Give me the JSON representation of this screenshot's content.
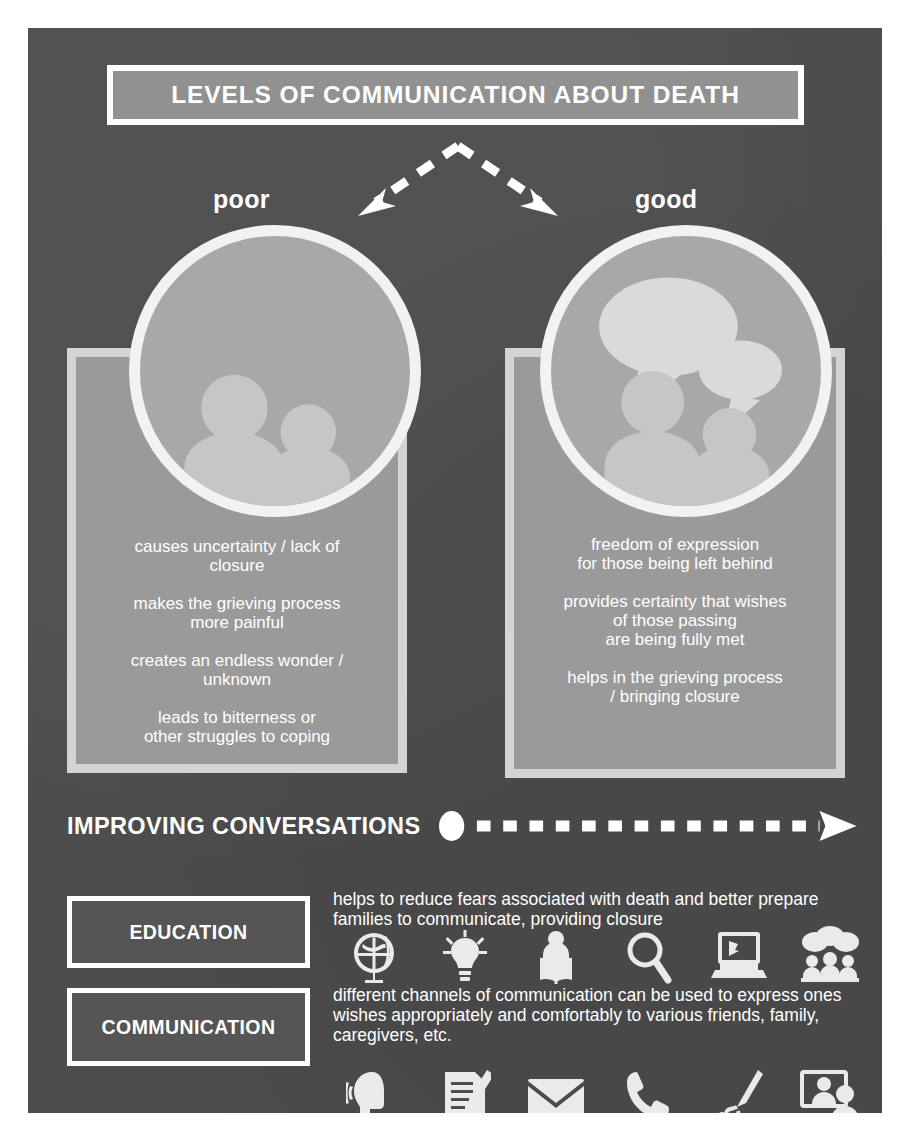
{
  "colors": {
    "background": "#ffffff",
    "poster": "#4c4c4c",
    "title_fill": "#919191",
    "panel_fill": "#9a9a9a",
    "panel_border": "#d4d4d4",
    "circle_fill": "#a8a8a8",
    "circle_border": "#f2f2f2",
    "tag_fill": "#555555",
    "text": "#ffffff"
  },
  "header": {
    "title": "LEVELS OF COMMUNICATION ABOUT DEATH"
  },
  "comparison": {
    "left": {
      "label": "poor",
      "icon": "two-people-silhouette-icon",
      "points": [
        "causes uncertainty / lack  of\nclosure",
        "makes the grieving process\nmore painful",
        "creates an endless wonder /\nunknown",
        "leads to bitterness or\nother struggles to coping"
      ]
    },
    "right": {
      "label": "good",
      "icon": "two-people-talking-speech-bubbles-icon",
      "points": [
        "freedom of expression\nfor those being left behind",
        "provides certainty that wishes\nof those passing\nare being fully met",
        "helps in the grieving process\n/ bringing closure"
      ]
    }
  },
  "improving": {
    "label": "IMPROVING CONVERSATIONS",
    "arrow": "dashed-arrow-right-icon"
  },
  "sections": [
    {
      "tag": "EDUCATION",
      "text": "helps to reduce fears associated with death and better prepare families to communicate, providing closure",
      "icons": [
        "globe-icon",
        "lightbulb-icon",
        "person-reading-book-icon",
        "magnifying-glass-icon",
        "laptop-cursor-icon",
        "group-discussion-icon"
      ]
    },
    {
      "tag": "COMMUNICATION",
      "text": "different channels of communication can be used to express ones wishes appropriately and comfortably to various friends, family, caregivers, etc.",
      "icons": [
        "speaking-head-icon",
        "notepad-pencil-icon",
        "envelope-icon",
        "phone-handset-icon",
        "microphone-icon",
        "video-call-icon"
      ]
    }
  ]
}
